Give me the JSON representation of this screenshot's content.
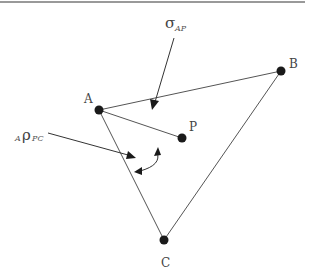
{
  "figure": {
    "type": "geometry-diagram",
    "points": [
      {
        "id": "A",
        "label": "A"
      },
      {
        "id": "B",
        "label": "B"
      },
      {
        "id": "P",
        "label": "P"
      },
      {
        "id": "C",
        "label": "C"
      }
    ],
    "edges": [
      [
        "A",
        "B"
      ],
      [
        "A",
        "P"
      ],
      [
        "A",
        "C"
      ],
      [
        "B",
        "C"
      ]
    ],
    "annotations": {
      "sigma": {
        "symbol": "σ",
        "subscript": "AP"
      },
      "rho": {
        "prefix": "A",
        "symbol": "ρ",
        "subscript": "PC"
      }
    },
    "colors": {
      "ink": "#1a1a1a",
      "line": "#555555",
      "text": "#444444"
    }
  }
}
